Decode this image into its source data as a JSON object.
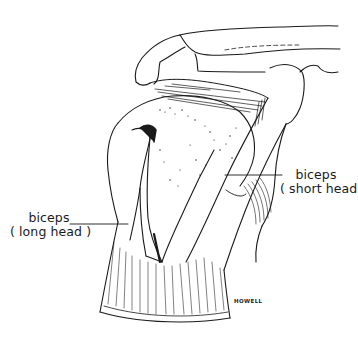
{
  "figure": {
    "labels": [
      {
        "id": "short-head",
        "line1": "biceps",
        "line2": "( short head )"
      },
      {
        "id": "long-head",
        "line1": "biceps",
        "line2": "( long head )"
      }
    ],
    "signature": "HOWELL",
    "colors": {
      "ink": "#1a1a1a",
      "background": "#ffffff"
    }
  }
}
